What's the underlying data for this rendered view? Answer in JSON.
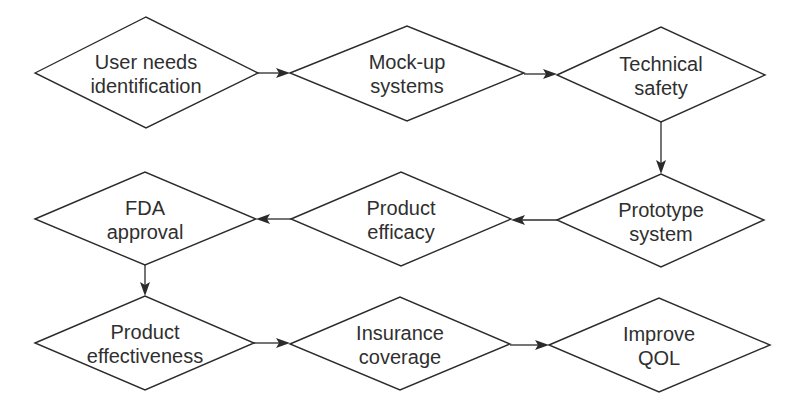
{
  "diagram": {
    "type": "flowchart",
    "shape": "diamond",
    "nodes": [
      {
        "id": "n1",
        "line1": "User needs",
        "line2": "identification"
      },
      {
        "id": "n2",
        "line1": "Mock-up",
        "line2": "systems"
      },
      {
        "id": "n3",
        "line1": "Technical",
        "line2": "safety"
      },
      {
        "id": "n4",
        "line1": "Prototype",
        "line2": "system"
      },
      {
        "id": "n5",
        "line1": "Product",
        "line2": "efficacy"
      },
      {
        "id": "n6",
        "line1": "FDA",
        "line2": "approval"
      },
      {
        "id": "n7",
        "line1": "Product",
        "line2": "effectiveness"
      },
      {
        "id": "n8",
        "line1": "Insurance",
        "line2": "coverage"
      },
      {
        "id": "n9",
        "line1": "Improve",
        "line2": "QOL"
      }
    ],
    "edges": [
      {
        "from": "n1",
        "to": "n2"
      },
      {
        "from": "n2",
        "to": "n3"
      },
      {
        "from": "n3",
        "to": "n4"
      },
      {
        "from": "n4",
        "to": "n5"
      },
      {
        "from": "n5",
        "to": "n6"
      },
      {
        "from": "n6",
        "to": "n7"
      },
      {
        "from": "n7",
        "to": "n8"
      },
      {
        "from": "n8",
        "to": "n9"
      }
    ],
    "colors": {
      "stroke": "#2b2b2b",
      "text": "#2f2f2f",
      "background": "#ffffff"
    }
  }
}
